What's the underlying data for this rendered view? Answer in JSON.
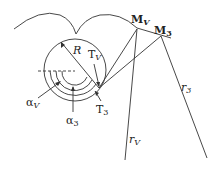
{
  "diagram": {
    "colors": {
      "stroke": "#333333",
      "background": "#ffffff"
    },
    "labels": {
      "M_V": {
        "main": "M",
        "sub": "V"
      },
      "M_3": {
        "main": "M",
        "sub": "3"
      },
      "R": "R",
      "T_V": {
        "main": "T",
        "sub": "V"
      },
      "T_3": {
        "main": "T",
        "sub": "3"
      },
      "alpha_V": {
        "main": "α",
        "sub": "V"
      },
      "alpha_3": {
        "main": "α",
        "sub": "3"
      },
      "r_3": {
        "main": "r",
        "sub": "3"
      },
      "r_V": {
        "main": "r",
        "sub": "V"
      }
    }
  }
}
